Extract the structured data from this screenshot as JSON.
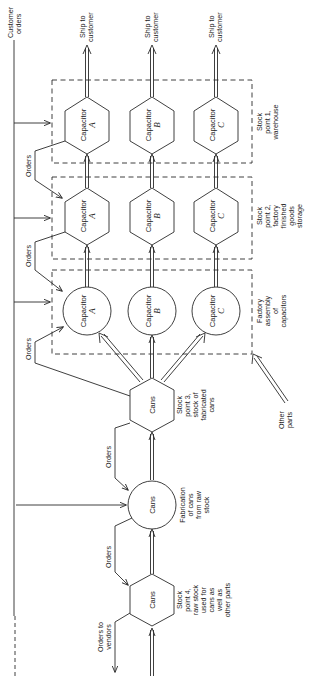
{
  "diagram": {
    "colors": {
      "ink": "#2a2a2a",
      "background": "#ffffff"
    },
    "top_labels": {
      "customer_orders": [
        "Customer",
        "orders"
      ],
      "ship_a": [
        "Ship to",
        "customer"
      ],
      "ship_b": [
        "Ship to",
        "customer"
      ],
      "ship_c": [
        "Ship to",
        "customer"
      ]
    },
    "orders_labels": [
      "Orders",
      "Orders",
      "Orders",
      "Orders",
      "Orders"
    ],
    "orders_to_vendors": [
      "Orders to",
      "vendors"
    ],
    "stock_point_1": {
      "label": [
        "Stock",
        "point 1,",
        "warehouse"
      ],
      "nodes": [
        {
          "name": "Capacitor",
          "letter": "A"
        },
        {
          "name": "Capacitor",
          "letter": "B"
        },
        {
          "name": "Capacitor",
          "letter": "C"
        }
      ]
    },
    "stock_point_2": {
      "label": [
        "Stock",
        "point 2,",
        "factory",
        "finished",
        "goods",
        "storage"
      ],
      "nodes": [
        {
          "name": "Capacitor",
          "letter": "A"
        },
        {
          "name": "Capacitor",
          "letter": "B"
        },
        {
          "name": "Capacitor",
          "letter": "C"
        }
      ]
    },
    "factory_assembly": {
      "label": [
        "Factory",
        "assembly",
        "of",
        "capacitors"
      ],
      "nodes": [
        {
          "name": "Capacitor",
          "letter": "A"
        },
        {
          "name": "Capacitor",
          "letter": "B"
        },
        {
          "name": "Capacitor",
          "letter": "C"
        }
      ]
    },
    "other_parts": [
      "Other",
      "parts"
    ],
    "stock_point_3": {
      "node": "Cans",
      "label": [
        "Stock",
        "point 3,",
        "stock of",
        "fabricated",
        "cans"
      ]
    },
    "fabrication": {
      "node": "Cans",
      "label": [
        "Fabrication",
        "of cans",
        "from raw",
        "stock"
      ]
    },
    "stock_point_4": {
      "node": "Cans",
      "label": [
        "Stock",
        "point 4,",
        "raw stock",
        "used for",
        "cans as",
        "well as",
        "other parts"
      ]
    }
  }
}
